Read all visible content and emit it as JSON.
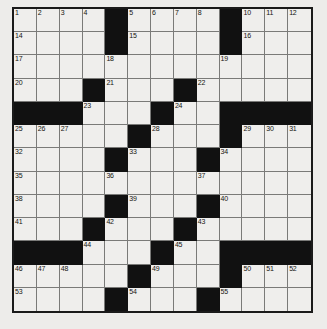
{
  "puzzle": {
    "title": "Crossword Grid",
    "type": "crossword",
    "rows": 13,
    "cols": 13,
    "colors": {
      "page_background": "#edecea",
      "cell_background": "#efeeec",
      "block_color": "#111111",
      "grid_line": "#7a7a78",
      "border_color": "#1a1a1a",
      "number_color": "#15150f"
    },
    "blocks": [
      [
        0,
        4
      ],
      [
        0,
        9
      ],
      [
        1,
        4
      ],
      [
        1,
        9
      ],
      [
        3,
        3
      ],
      [
        3,
        7
      ],
      [
        4,
        0
      ],
      [
        4,
        1
      ],
      [
        4,
        2
      ],
      [
        4,
        6
      ],
      [
        4,
        9
      ],
      [
        4,
        10
      ],
      [
        4,
        11
      ],
      [
        4,
        12
      ],
      [
        5,
        5
      ],
      [
        5,
        9
      ],
      [
        6,
        4
      ],
      [
        6,
        8
      ],
      [
        8,
        4
      ],
      [
        8,
        8
      ],
      [
        9,
        3
      ],
      [
        9,
        7
      ],
      [
        10,
        0
      ],
      [
        10,
        1
      ],
      [
        10,
        2
      ],
      [
        10,
        6
      ],
      [
        10,
        9
      ],
      [
        10,
        10
      ],
      [
        10,
        11
      ],
      [
        10,
        12
      ],
      [
        11,
        5
      ],
      [
        11,
        9
      ],
      [
        12,
        4
      ],
      [
        12,
        8
      ]
    ],
    "numbers": [
      {
        "row": 0,
        "col": 0,
        "n": "1"
      },
      {
        "row": 0,
        "col": 1,
        "n": "2"
      },
      {
        "row": 0,
        "col": 2,
        "n": "3"
      },
      {
        "row": 0,
        "col": 3,
        "n": "4"
      },
      {
        "row": 0,
        "col": 5,
        "n": "5"
      },
      {
        "row": 0,
        "col": 6,
        "n": "6"
      },
      {
        "row": 0,
        "col": 7,
        "n": "7"
      },
      {
        "row": 0,
        "col": 8,
        "n": "8"
      },
      {
        "row": 0,
        "col": 9,
        "n": "9"
      },
      {
        "row": 0,
        "col": 10,
        "n": "10"
      },
      {
        "row": 0,
        "col": 11,
        "n": "11"
      },
      {
        "row": 0,
        "col": 12,
        "n": "12"
      },
      {
        "row": 1,
        "col": 0,
        "n": "14"
      },
      {
        "row": 1,
        "col": 5,
        "n": "15"
      },
      {
        "row": 1,
        "col": 10,
        "n": "16"
      },
      {
        "row": 2,
        "col": 0,
        "n": "17"
      },
      {
        "row": 2,
        "col": 4,
        "n": "18"
      },
      {
        "row": 2,
        "col": 9,
        "n": "19"
      },
      {
        "row": 3,
        "col": 0,
        "n": "20"
      },
      {
        "row": 3,
        "col": 4,
        "n": "21"
      },
      {
        "row": 3,
        "col": 8,
        "n": "22"
      },
      {
        "row": 4,
        "col": 3,
        "n": "23"
      },
      {
        "row": 4,
        "col": 7,
        "n": "24"
      },
      {
        "row": 5,
        "col": 0,
        "n": "25"
      },
      {
        "row": 5,
        "col": 1,
        "n": "26"
      },
      {
        "row": 5,
        "col": 2,
        "n": "27"
      },
      {
        "row": 5,
        "col": 6,
        "n": "28"
      },
      {
        "row": 5,
        "col": 10,
        "n": "29"
      },
      {
        "row": 5,
        "col": 11,
        "n": "30"
      },
      {
        "row": 5,
        "col": 12,
        "n": "31"
      },
      {
        "row": 6,
        "col": 0,
        "n": "32"
      },
      {
        "row": 6,
        "col": 5,
        "n": "33"
      },
      {
        "row": 6,
        "col": 9,
        "n": "34"
      },
      {
        "row": 7,
        "col": 0,
        "n": "35"
      },
      {
        "row": 7,
        "col": 4,
        "n": "36"
      },
      {
        "row": 7,
        "col": 8,
        "n": "37"
      },
      {
        "row": 8,
        "col": 0,
        "n": "38"
      },
      {
        "row": 8,
        "col": 5,
        "n": "39"
      },
      {
        "row": 8,
        "col": 9,
        "n": "40"
      },
      {
        "row": 9,
        "col": 0,
        "n": "41"
      },
      {
        "row": 9,
        "col": 4,
        "n": "42"
      },
      {
        "row": 9,
        "col": 8,
        "n": "43"
      },
      {
        "row": 10,
        "col": 3,
        "n": "44"
      },
      {
        "row": 10,
        "col": 7,
        "n": "45"
      },
      {
        "row": 11,
        "col": 0,
        "n": "46"
      },
      {
        "row": 11,
        "col": 1,
        "n": "47"
      },
      {
        "row": 11,
        "col": 2,
        "n": "48"
      },
      {
        "row": 11,
        "col": 6,
        "n": "49"
      },
      {
        "row": 11,
        "col": 10,
        "n": "50"
      },
      {
        "row": 11,
        "col": 11,
        "n": "51"
      },
      {
        "row": 11,
        "col": 12,
        "n": "52"
      },
      {
        "row": 12,
        "col": 0,
        "n": "53"
      },
      {
        "row": 12,
        "col": 5,
        "n": "54"
      },
      {
        "row": 12,
        "col": 9,
        "n": "55"
      }
    ],
    "extra_numbers": [
      {
        "row": 13,
        "col": 0,
        "n": "56"
      },
      {
        "row": 13,
        "col": 5,
        "n": "57"
      },
      {
        "row": 13,
        "col": 9,
        "n": "58"
      },
      {
        "row": 14,
        "col": 0,
        "n": "59"
      },
      {
        "row": 14,
        "col": 5,
        "n": "60"
      },
      {
        "row": 14,
        "col": 9,
        "n": "61"
      }
    ]
  }
}
